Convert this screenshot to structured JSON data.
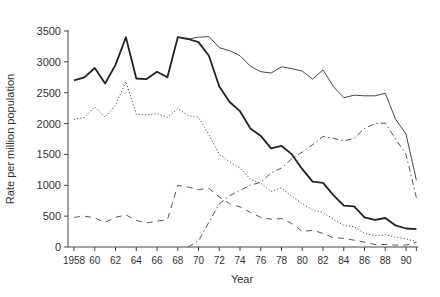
{
  "chart_data": {
    "type": "line",
    "title": "",
    "xlabel": "Year",
    "ylabel": "Rate per million population",
    "xlim": [
      1958,
      1991
    ],
    "ylim": [
      0,
      3500
    ],
    "yticks": [
      0,
      500,
      1000,
      1500,
      2000,
      2500,
      3000,
      3500
    ],
    "xtick_labels": [
      {
        "x": 1958,
        "label": "1958"
      },
      {
        "x": 1960,
        "label": "60"
      },
      {
        "x": 1962,
        "label": "62"
      },
      {
        "x": 1964,
        "label": "64"
      },
      {
        "x": 1966,
        "label": "66"
      },
      {
        "x": 1968,
        "label": "68"
      },
      {
        "x": 1970,
        "label": "70"
      },
      {
        "x": 1972,
        "label": "72"
      },
      {
        "x": 1974,
        "label": "74"
      },
      {
        "x": 1976,
        "label": "76"
      },
      {
        "x": 1978,
        "label": "78"
      },
      {
        "x": 1980,
        "label": "80"
      },
      {
        "x": 1982,
        "label": "82"
      },
      {
        "x": 1984,
        "label": "84"
      },
      {
        "x": 1986,
        "label": "86"
      },
      {
        "x": 1988,
        "label": "88"
      },
      {
        "x": 1990,
        "label": "90"
      }
    ],
    "grid": false,
    "legend": null,
    "series": [
      {
        "name": "thick-solid",
        "style": "solid",
        "width": 1.8,
        "color": "#222222",
        "x": [
          1958,
          1959,
          1960,
          1961,
          1962,
          1963,
          1964,
          1965,
          1966,
          1967,
          1968,
          1969,
          1970,
          1971,
          1972,
          1973,
          1974,
          1975,
          1976,
          1977,
          1978,
          1979,
          1980,
          1981,
          1982,
          1983,
          1984,
          1985,
          1986,
          1987,
          1988,
          1989,
          1990,
          1991
        ],
        "values": [
          2700,
          2750,
          2900,
          2650,
          2950,
          3400,
          2730,
          2720,
          2840,
          2750,
          3400,
          3370,
          3320,
          3100,
          2600,
          2350,
          2200,
          1920,
          1800,
          1600,
          1640,
          1500,
          1260,
          1060,
          1040,
          840,
          670,
          660,
          480,
          440,
          470,
          350,
          300,
          290
        ]
      },
      {
        "name": "thin-solid",
        "style": "solid",
        "width": 0.9,
        "color": "#333333",
        "x": [
          1968,
          1969,
          1970,
          1971,
          1972,
          1973,
          1974,
          1975,
          1976,
          1977,
          1978,
          1979,
          1980,
          1981,
          1982,
          1983,
          1984,
          1985,
          1986,
          1987,
          1988,
          1989,
          1990,
          1991
        ],
        "values": [
          3400,
          3370,
          3400,
          3410,
          3230,
          3180,
          3100,
          2930,
          2840,
          2820,
          2920,
          2890,
          2850,
          2720,
          2870,
          2600,
          2420,
          2460,
          2450,
          2450,
          2490,
          2070,
          1830,
          1080
        ]
      },
      {
        "name": "dotted",
        "style": "dotted",
        "width": 1,
        "color": "#555555",
        "x": [
          1958,
          1959,
          1960,
          1961,
          1962,
          1963,
          1964,
          1965,
          1966,
          1967,
          1968,
          1969,
          1970,
          1971,
          1972,
          1973,
          1974,
          1975,
          1976,
          1977,
          1978,
          1979,
          1980,
          1981,
          1982,
          1983,
          1984,
          1985,
          1986,
          1987,
          1988,
          1989,
          1990,
          1991
        ],
        "values": [
          2070,
          2100,
          2270,
          2100,
          2300,
          2680,
          2150,
          2140,
          2160,
          2100,
          2240,
          2130,
          2100,
          1820,
          1500,
          1380,
          1280,
          1100,
          1030,
          900,
          960,
          820,
          700,
          600,
          560,
          450,
          350,
          330,
          220,
          180,
          200,
          160,
          130,
          90
        ]
      },
      {
        "name": "dashed",
        "style": "dashed",
        "width": 1,
        "color": "#555555",
        "x": [
          1958,
          1959,
          1960,
          1961,
          1962,
          1963,
          1964,
          1965,
          1966,
          1967,
          1968,
          1969,
          1970,
          1971,
          1972,
          1973,
          1974,
          1975,
          1976,
          1977,
          1978,
          1979,
          1980,
          1981,
          1982,
          1983,
          1984,
          1985,
          1986,
          1987,
          1988,
          1989,
          1990,
          1991
        ],
        "values": [
          480,
          500,
          470,
          400,
          480,
          520,
          430,
          390,
          420,
          440,
          1000,
          970,
          930,
          950,
          810,
          700,
          650,
          560,
          480,
          450,
          460,
          380,
          250,
          270,
          220,
          150,
          140,
          110,
          80,
          40,
          40,
          30,
          30,
          80
        ]
      },
      {
        "name": "dash-dot",
        "style": "dashdot",
        "width": 1,
        "color": "#555555",
        "x": [
          1969,
          1970,
          1971,
          1972,
          1973,
          1974,
          1975,
          1976,
          1977,
          1978,
          1979,
          1980,
          1981,
          1982,
          1983,
          1984,
          1985,
          1986,
          1987,
          1988,
          1989,
          1990,
          1991
        ],
        "values": [
          0,
          100,
          400,
          700,
          830,
          920,
          1000,
          1050,
          1200,
          1280,
          1430,
          1540,
          1660,
          1790,
          1760,
          1720,
          1760,
          1920,
          2000,
          2010,
          1750,
          1500,
          800
        ]
      }
    ]
  },
  "labels": {
    "xlabel": "Year",
    "ylabel": "Rate per million population"
  }
}
